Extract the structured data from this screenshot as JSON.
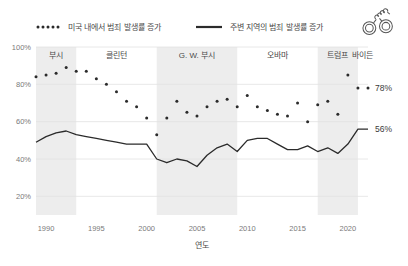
{
  "legend": {
    "position": "top",
    "items": [
      {
        "name": "nationwide",
        "label": "미국 내에서 범죄 발생률 증가",
        "style": "dotted",
        "color": "#2b2b2b"
      },
      {
        "name": "local",
        "label": "주변 지역의 범죄 발생률 증가",
        "style": "solid",
        "color": "#2b2b2b"
      }
    ]
  },
  "icon": {
    "name": "handcuffs-icon",
    "color": "#555555"
  },
  "chart_data": {
    "type": "line",
    "title": "",
    "subtitle": "",
    "xlabel": "연도",
    "ylabel": "",
    "xlim": [
      1989,
      2022
    ],
    "ylim": [
      10,
      100
    ],
    "grid": true,
    "xticks": [
      1990,
      1995,
      2000,
      2005,
      2010,
      2015,
      2020
    ],
    "xtick_labels": [
      "1990",
      "1995",
      "2000",
      "2005",
      "2010",
      "2015",
      "2020"
    ],
    "yticks": [
      20,
      40,
      60,
      80,
      100
    ],
    "ytick_labels": [
      "20%",
      "40%",
      "60%",
      "80%",
      "100%"
    ],
    "x": [
      1989,
      1990,
      1991,
      1992,
      1993,
      1994,
      1995,
      1996,
      1997,
      1998,
      1999,
      2000,
      2001,
      2002,
      2003,
      2004,
      2005,
      2006,
      2007,
      2008,
      2009,
      2010,
      2011,
      2012,
      2013,
      2014,
      2015,
      2016,
      2017,
      2018,
      2019,
      2020,
      2021,
      2022
    ],
    "series": [
      {
        "name": "nationwide",
        "label": "미국 내에서 범죄 발생률 증가",
        "style": "dotted",
        "color": "#2b2b2b",
        "values": [
          84,
          85,
          86,
          89,
          87,
          87,
          83,
          80,
          76,
          71,
          68,
          62,
          53,
          62,
          71,
          65,
          63,
          68,
          71,
          72,
          68,
          74,
          68,
          66,
          64,
          63,
          70,
          60,
          69,
          71,
          64,
          85,
          78,
          78
        ],
        "end_label": "78%"
      },
      {
        "name": "local",
        "label": "주변 지역의 범죄 발생률 증가",
        "style": "solid",
        "color": "#2b2b2b",
        "values": [
          49,
          52,
          54,
          55,
          53,
          52,
          51,
          50,
          49,
          48,
          48,
          48,
          40,
          38,
          40,
          39,
          36,
          42,
          46,
          48,
          44,
          50,
          51,
          51,
          48,
          45,
          45,
          47,
          44,
          46,
          43,
          48,
          56,
          56
        ],
        "end_label": "56%"
      }
    ],
    "eras": [
      {
        "name": "bush",
        "label": "부시",
        "start": 1989,
        "end": 1993,
        "shaded": true
      },
      {
        "name": "clinton",
        "label": "클린턴",
        "start": 1993,
        "end": 2001,
        "shaded": false
      },
      {
        "name": "gw-bush",
        "label": "G. W. 부시",
        "start": 2001,
        "end": 2009,
        "shaded": true
      },
      {
        "name": "obama",
        "label": "오바마",
        "start": 2009,
        "end": 2017,
        "shaded": false
      },
      {
        "name": "trump",
        "label": "트럼프",
        "start": 2017,
        "end": 2021,
        "shaded": true
      },
      {
        "name": "biden",
        "label": "바이든",
        "start": 2021,
        "end": 2022.6,
        "shaded": false
      }
    ]
  },
  "colors": {
    "shade": "#ededed",
    "grid": "#e2e2e2",
    "axis_text": "#7a7a7a",
    "ink": "#2b2b2b"
  }
}
